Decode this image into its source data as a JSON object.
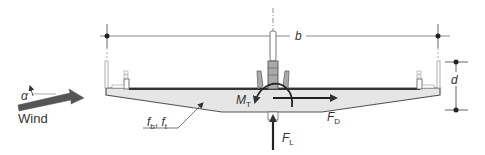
{
  "diagram": {
    "labels": {
      "width": "b",
      "depth": "d",
      "wind": "Wind",
      "angle": "α",
      "torsional_moment": "M",
      "torsional_moment_sub": "T",
      "drag_force": "F",
      "drag_force_sub": "D",
      "lift_force": "F",
      "lift_force_sub": "L",
      "frequencies": "f",
      "freq_b_sub": "b",
      "freq_sep": ", ",
      "freq_t": "f",
      "freq_t_sub": "t"
    },
    "colors": {
      "deck_fill": "#e6e6e6",
      "deck_stroke": "#555555",
      "arrow": "#333333",
      "wind_arrow": "#555555",
      "dim_line": "#888888"
    }
  }
}
